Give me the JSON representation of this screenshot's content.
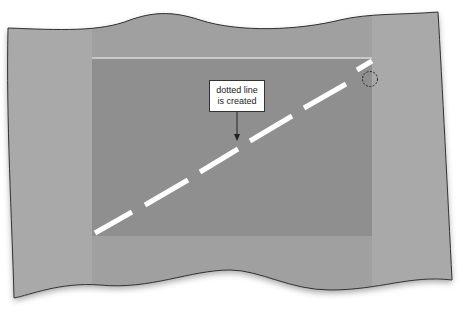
{
  "callout": {
    "line1": "dotted line",
    "line2": "is created"
  },
  "canvas": {
    "outer_bg": "#a6a6a6",
    "inner_bg": "#8f8f8f",
    "line_color": "#ffffff",
    "tool_cursor": "brush-circle-cursor"
  }
}
